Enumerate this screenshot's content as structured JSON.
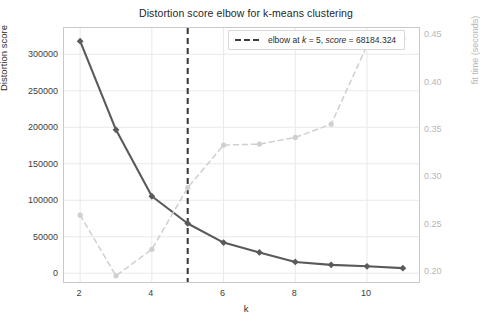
{
  "chart_data": {
    "type": "line",
    "title": "Distortion score elbow for k-means clustering",
    "xlabel": "k",
    "ylabel": "Distortion score",
    "y2label": "fit time (seconds)",
    "x": [
      2,
      3,
      4,
      5,
      6,
      7,
      8,
      9,
      10,
      11
    ],
    "xlim": [
      1.55,
      11.45
    ],
    "ylim": [
      -12000,
      336000
    ],
    "y2lim": [
      0.1885,
      0.4565
    ],
    "xticks": [
      2,
      4,
      6,
      8,
      10
    ],
    "xticklabels": [
      "2",
      "4",
      "6",
      "8",
      "10"
    ],
    "yticks": [
      0,
      50000,
      100000,
      150000,
      200000,
      250000,
      300000
    ],
    "yticklabels": [
      "0",
      "50000",
      "100000",
      "150000",
      "200000",
      "250000",
      "300000"
    ],
    "y2ticks": [
      0.2,
      0.25,
      0.3,
      0.35,
      0.4,
      0.45
    ],
    "y2ticklabels": [
      "0.20",
      "0.25",
      "0.30",
      "0.35",
      "0.40",
      "0.45"
    ],
    "grid": true,
    "legend_position": "upper right",
    "series": [
      {
        "name": "distortion score",
        "axis": "left",
        "style": "solid",
        "marker": "diamond",
        "color": "#5a5a5a",
        "values": [
          318000,
          196500,
          105500,
          68184.324,
          42000,
          28500,
          15500,
          11500,
          9500,
          7000
        ]
      },
      {
        "name": "fit time",
        "axis": "right",
        "style": "dashed",
        "marker": "circle",
        "color": "#cfcfcf",
        "values": [
          0.259,
          0.195,
          0.223,
          0.288,
          0.333,
          0.334,
          0.341,
          0.355,
          0.438,
          0.445
        ]
      }
    ],
    "annotations": [
      {
        "name": "elbow-line",
        "type": "vline",
        "x": 5,
        "style": "dashed",
        "color": "#3c3c3c",
        "label": "elbow at $k = 5$, $score = 68184.324$"
      }
    ]
  },
  "legend": {
    "prefix": "elbow at ",
    "k_var": "k",
    "eq1": " = 5, ",
    "score_var": "score",
    "eq2": " = 68184.324"
  }
}
